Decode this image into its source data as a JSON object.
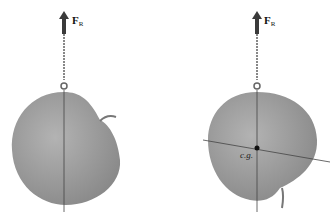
{
  "figure": {
    "left_panel": {
      "force_label": "F",
      "force_subscript": "R",
      "description": "apple suspended by cord, vertical line of action through suspension point"
    },
    "right_panel": {
      "force_label": "F",
      "force_subscript": "R",
      "center_label": "c.g.",
      "description": "apple suspended from a second point; lines intersect at center of gravity"
    },
    "colors": {
      "apple": "#9e9e9e",
      "apple_shadow": "#7d7d7d",
      "arrow": "#3a3a3a",
      "line": "#444444"
    }
  }
}
